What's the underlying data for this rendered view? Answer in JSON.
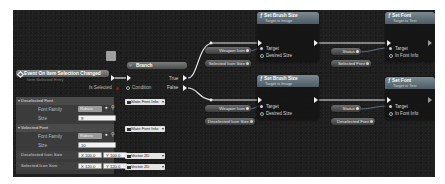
{
  "event_node": {
    "title": "Event On Item Selection Changed",
    "subtitle": "Item Selected Entry",
    "pins": {
      "is_selected": "Is Selected"
    }
  },
  "branch_node": {
    "title": "Branch",
    "pins": {
      "condition": "Condition",
      "true": "True",
      "false": "False"
    }
  },
  "details_panel": {
    "categories": [
      {
        "label": "Deselected Font",
        "font_family_label": "Font Family",
        "font_family_value": "Roboto",
        "size_label": "Size",
        "size_value": "9"
      },
      {
        "label": "Selected Font",
        "font_family_label": "Font Family",
        "font_family_value": "Roboto",
        "size_label": "Size",
        "size_value": "10"
      }
    ],
    "vectors": [
      {
        "label": "Deselected Icon Size",
        "x": "X 100.0",
        "y": "Y 100.0"
      },
      {
        "label": "Selected Icon Size",
        "x": "X 120.0",
        "y": "Y 120.0"
      }
    ],
    "type_dropdowns": [
      "Slate Font Info",
      "Slate Font Info",
      "Vector 2D",
      "Vector 2D"
    ]
  },
  "set_brush_size_top": {
    "title": "Set Brush Size",
    "subtitle": "Target is Image",
    "pins": {
      "target": "Target",
      "desired_size": "Desired Size"
    }
  },
  "set_brush_size_bottom": {
    "title": "Set Brush Size",
    "subtitle": "Target is Image",
    "pins": {
      "target": "Target",
      "desired_size": "Desired Size"
    }
  },
  "set_font_top": {
    "title": "Set Font",
    "subtitle": "Target is Text",
    "pins": {
      "target": "Target",
      "in_font_info": "In Font Info"
    }
  },
  "set_font_bottom": {
    "title": "Set Font",
    "subtitle": "Target is Text",
    "pins": {
      "target": "Target",
      "in_font_info": "In Font Info"
    }
  },
  "variables": {
    "weapon_icon_1": "Weapon Icon",
    "selected_icon_size": "Selected Icon Size",
    "status_1": "Status",
    "selected_font": "Selected Font",
    "weapon_icon_2": "Weapon Icon",
    "deselected_icon_size": "Deselected Icon Size",
    "status_2": "Status",
    "deselected_font": "Deselected Font"
  }
}
